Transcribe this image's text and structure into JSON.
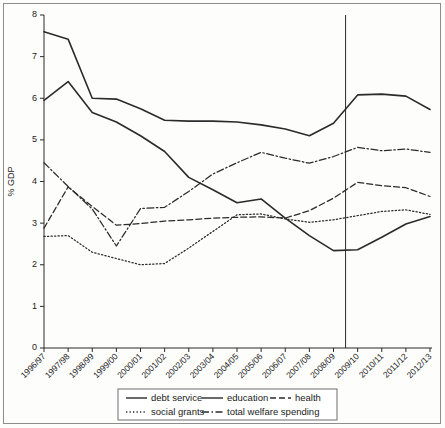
{
  "chart_data": {
    "type": "line",
    "title": "",
    "xlabel": "",
    "ylabel": "% GDP",
    "ylim": [
      0,
      8
    ],
    "yticks": [
      "0",
      "1",
      "2",
      "3",
      "4",
      "5",
      "6",
      "7",
      "8"
    ],
    "grid": false,
    "legend_position": "below-axes",
    "annotations": [
      {
        "name": "forecast-divider",
        "type": "vertical-line",
        "at_category": "2008/09-2009/10 boundary"
      }
    ],
    "categories": [
      "1996/97",
      "1997/98",
      "1998/99",
      "1999/00",
      "2000/01",
      "2001/02",
      "2002/03",
      "2003/04",
      "2004/05",
      "2005/06",
      "2006/07",
      "2007/08",
      "2008/09",
      "2009/10",
      "2010/11",
      "2011/12",
      "2012/13"
    ],
    "series": [
      {
        "name": "debt service",
        "style": "solid",
        "values": [
          7.6,
          7.42,
          6.0,
          5.98,
          5.75,
          5.47,
          5.45,
          5.45,
          5.43,
          5.36,
          5.26,
          5.1,
          5.4,
          6.08,
          6.1,
          6.05,
          5.73
        ]
      },
      {
        "name": "education",
        "style": "solid",
        "values": [
          5.95,
          6.4,
          5.66,
          5.43,
          5.1,
          4.72,
          4.1,
          3.8,
          3.49,
          3.58,
          3.12,
          2.7,
          2.34,
          2.36,
          2.66,
          2.98,
          3.16
        ]
      },
      {
        "name": "health",
        "style": "dashed",
        "values": [
          2.88,
          3.87,
          3.4,
          2.95,
          2.99,
          3.05,
          3.08,
          3.12,
          3.14,
          3.15,
          3.12,
          3.3,
          3.6,
          3.98,
          3.9,
          3.85,
          3.64
        ]
      },
      {
        "name": "social grants",
        "style": "dotted",
        "values": [
          2.68,
          2.7,
          2.3,
          2.15,
          2.0,
          2.03,
          2.4,
          2.8,
          3.2,
          3.22,
          3.1,
          3.02,
          3.08,
          3.18,
          3.28,
          3.32,
          3.21
        ]
      },
      {
        "name": "total welfare spending",
        "style": "dash-dot",
        "values": [
          4.45,
          3.88,
          3.34,
          2.45,
          3.35,
          3.38,
          3.76,
          4.18,
          4.45,
          4.7,
          4.56,
          4.44,
          4.6,
          4.82,
          4.74,
          4.78,
          4.7
        ]
      }
    ]
  },
  "legend": {
    "entries": [
      {
        "label": "debt service",
        "style": "solid"
      },
      {
        "label": "education",
        "style": "solid"
      },
      {
        "label": "health",
        "style": "dashed"
      },
      {
        "label": "social grants",
        "style": "dotted"
      },
      {
        "label": "total welfare spending",
        "style": "dash-dot"
      }
    ]
  },
  "colors": {
    "line": "#2b2b2b",
    "axis": "#2b2b2b",
    "frame": "#8d8d8d",
    "background": "#fdfdfc"
  }
}
